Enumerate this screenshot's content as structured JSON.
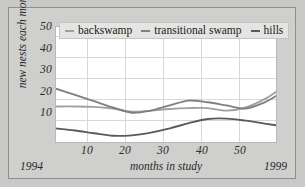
{
  "chart_data": {
    "type": "line",
    "title": "",
    "xlabel": "months in study",
    "ylabel": "new nests each month",
    "xlim": [
      0,
      58
    ],
    "ylim": [
      0,
      55
    ],
    "xticks": [
      10,
      20,
      30,
      40,
      50
    ],
    "yticks": [
      10,
      20,
      30,
      40,
      50
    ],
    "grid": true,
    "legend_position": "top",
    "x_start_annotation": "1994",
    "x_end_annotation": "1999",
    "x": [
      0,
      5,
      10,
      15,
      20,
      25,
      30,
      35,
      40,
      45,
      50,
      55,
      58
    ],
    "series": [
      {
        "name": "backswamp",
        "color": "#a0a0a0",
        "values": [
          17.0,
          17.0,
          16.8,
          16.0,
          14.5,
          15.0,
          15.8,
          16.2,
          16.2,
          15.0,
          16.5,
          20.5,
          24.0
        ]
      },
      {
        "name": "transitional swamp",
        "color": "#808080",
        "values": [
          25.5,
          22.5,
          19.5,
          16.5,
          14.0,
          15.0,
          17.5,
          19.8,
          19.0,
          17.5,
          16.0,
          19.0,
          22.0
        ]
      },
      {
        "name": "hills",
        "color": "#5a5a5a",
        "values": [
          6.5,
          5.5,
          4.2,
          3.0,
          3.2,
          4.5,
          6.5,
          9.0,
          11.0,
          11.2,
          10.2,
          8.8,
          8.0
        ]
      }
    ]
  },
  "legend": {
    "items": [
      {
        "label": "backswamp"
      },
      {
        "label": "transitional swamp"
      },
      {
        "label": "hills"
      }
    ]
  },
  "axes": {
    "y_tick_labels": [
      "50",
      "40",
      "30",
      "20",
      "10"
    ],
    "x_tick_labels": [
      "10",
      "20",
      "30",
      "40",
      "50"
    ],
    "y_axis_title": "new nests each month",
    "x_axis_title": "months in study",
    "year_start": "1994",
    "year_end": "1999"
  },
  "colors": {
    "figure_background": "#c9c9c7",
    "frame_background": "#cfcfcd",
    "plot_background": "#ffffff",
    "grid": "#d4d4d2",
    "text": "#2b2b2b"
  }
}
